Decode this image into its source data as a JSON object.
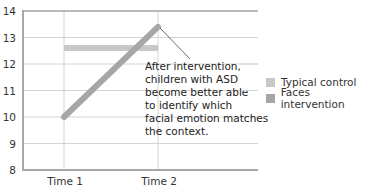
{
  "chart_data": {
    "type": "line",
    "title": "",
    "xlabel": "",
    "ylabel": "",
    "categories": [
      "Time 1",
      "Time 2"
    ],
    "ylim": [
      8,
      14
    ],
    "yticks": [
      8,
      9,
      10,
      11,
      12,
      13,
      14
    ],
    "grid": true,
    "legend_position": "right",
    "series": [
      {
        "name": "Typical control",
        "values": [
          12.6,
          12.6
        ],
        "color": "#c8c8c8"
      },
      {
        "name": "Faces intervention",
        "values": [
          10.0,
          13.4
        ],
        "color": "#a6a6a6"
      }
    ],
    "annotation": {
      "lines": [
        "After intervention,",
        "children with ASD",
        "become better able",
        "to identify which",
        "facial emotion matches",
        "the context."
      ],
      "points_to": {
        "series": "Faces intervention",
        "category": "Time 2"
      }
    }
  },
  "legend": {
    "items": [
      {
        "label": "Typical control",
        "color": "#c8c8c8"
      },
      {
        "label": "Faces intervention",
        "color": "#a6a6a6"
      }
    ]
  },
  "axis": {
    "y_labels": [
      "14",
      "13",
      "12",
      "11",
      "10",
      "9",
      "8"
    ],
    "x_labels": [
      "Time 1",
      "Time 2"
    ]
  }
}
